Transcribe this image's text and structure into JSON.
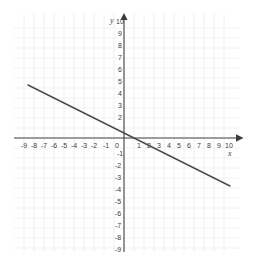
{
  "chart_data": {
    "type": "line",
    "title": "",
    "xlabel": "x",
    "ylabel": "y",
    "grid": true,
    "legend": "none",
    "xlim": [
      -10,
      10.8
    ],
    "ylim": [
      -9.8,
      10.6
    ],
    "xticks": [
      -9,
      -8,
      -7,
      -6,
      -5,
      -4,
      -3,
      -2,
      -1,
      0,
      1,
      2,
      3,
      4,
      5,
      6,
      7,
      8,
      9,
      10
    ],
    "yticks": [
      10,
      9,
      8,
      7,
      6,
      5,
      4,
      3,
      2,
      1,
      -1,
      -2,
      -3,
      -4,
      -5,
      -6,
      -7,
      -8,
      -9
    ],
    "xtick_labels": [
      "-9",
      "-8",
      "-7",
      "-6",
      "-5",
      "-4",
      "-3",
      "-2",
      "-1",
      "0",
      "1",
      "2",
      "3",
      "4",
      "5",
      "6",
      "7",
      "8",
      "9",
      "10"
    ],
    "ytick_labels": [
      "10",
      "9",
      "8",
      "7",
      "6",
      "5",
      "4",
      "3",
      "2",
      "-1",
      "-2",
      "-3",
      "-4",
      "-5",
      "-6",
      "-7",
      "-8",
      "-9"
    ],
    "series": [
      {
        "name": "line",
        "slope": -0.5,
        "intercept": 0.5,
        "x": [
          -9.6,
          10.6
        ],
        "y": [
          5.3,
          -4.8
        ],
        "x_intercept": 1,
        "y_intercept": 0.5,
        "color": "#4a4a4a"
      }
    ],
    "colors": {
      "line": "#4a4a4a",
      "axis": "#3d3d3d",
      "grid": "#e9ecef",
      "background": "#ffffff",
      "text": "#3d3d3d"
    }
  },
  "axes": {
    "x_label": "x",
    "y_label": "y"
  },
  "ticks": {
    "x_negative": [
      "-9",
      "-8",
      "-7",
      "-6",
      "-5",
      "-4",
      "-3",
      "-2",
      "-1"
    ],
    "x_origin": "0",
    "x_positive": [
      "1",
      "2",
      "3",
      "4",
      "5",
      "6",
      "7",
      "8",
      "9",
      "10"
    ],
    "y_positive": [
      "10",
      "9",
      "8",
      "7",
      "6",
      "5",
      "4",
      "3",
      "2"
    ],
    "y_negative": [
      "-1",
      "-2",
      "-3",
      "-4",
      "-5",
      "-6",
      "-7",
      "-8",
      "-9"
    ]
  }
}
